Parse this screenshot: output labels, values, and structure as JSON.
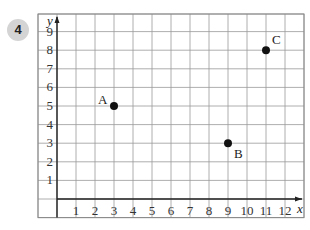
{
  "question": {
    "number": "4"
  },
  "chart_data": {
    "type": "scatter",
    "title": "",
    "xlabel": "x",
    "ylabel": "y",
    "x_ticks": [
      "1",
      "2",
      "3",
      "4",
      "5",
      "6",
      "7",
      "8",
      "9",
      "10",
      "11",
      "12"
    ],
    "y_ticks": [
      "1",
      "2",
      "3",
      "4",
      "5",
      "6",
      "7",
      "8",
      "9"
    ],
    "xlim": [
      -1,
      13
    ],
    "ylim": [
      -1,
      10
    ],
    "grid": true,
    "points": [
      {
        "label": "A",
        "x": 3,
        "y": 5
      },
      {
        "label": "B",
        "x": 9,
        "y": 3
      },
      {
        "label": "C",
        "x": 11,
        "y": 8
      }
    ]
  }
}
